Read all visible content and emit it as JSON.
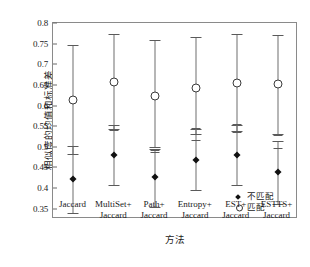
{
  "chart_data": {
    "type": "scatter",
    "title": "",
    "xlabel": "方法",
    "ylabel": "相似度的均值和标准差",
    "categories": [
      "Jaccard",
      "MultiSet+ Jaccard",
      "Path+ Jaccard",
      "Entropy+ Jaccard",
      "EST+ Jaccard",
      "ESTTS+ Jaccard"
    ],
    "category_lines": [
      [
        "Jaccard",
        ""
      ],
      [
        "MultiSet+",
        "Jaccard"
      ],
      [
        "Path+",
        "Jaccard"
      ],
      [
        "Entropy+",
        "Jaccard"
      ],
      [
        "EST+",
        "Jaccard"
      ],
      [
        "ESTTS+",
        "Jaccard"
      ]
    ],
    "ylim": [
      0.325,
      0.8
    ],
    "yticks": [
      0.35,
      0.4,
      0.45,
      0.5,
      0.55,
      0.6,
      0.65,
      0.7,
      0.75,
      0.8
    ],
    "ytick_labels": [
      "0.35",
      "0.4",
      "0.45",
      "0.5",
      "0.55",
      "0.6",
      "0.65",
      "0.7",
      "0.75",
      "0.8"
    ],
    "grid": false,
    "legend_position": "bottom-right",
    "series": [
      {
        "name": "不匹配",
        "marker": "filled-diamond",
        "values": [
          0.421,
          0.481,
          0.427,
          0.469,
          0.481,
          0.438
        ],
        "err_low": [
          0.339,
          0.407,
          0.355,
          0.396,
          0.408,
          0.362
        ],
        "err_high": [
          0.502,
          0.552,
          0.494,
          0.543,
          0.553,
          0.513
        ],
        "inner_tick": [
          0.482,
          0.54,
          0.487,
          0.517,
          0.536,
          0.497
        ]
      },
      {
        "name": "匹配",
        "marker": "open-circle",
        "values": [
          0.614,
          0.658,
          0.623,
          0.643,
          0.655,
          0.651
        ],
        "err_low": [
          0.483,
          0.543,
          0.499,
          0.531,
          0.539,
          0.531
        ],
        "err_high": [
          0.746,
          0.773,
          0.758,
          0.766,
          0.773,
          0.772
        ],
        "inner_tick": [
          0.501,
          0.553,
          0.492,
          0.545,
          0.556,
          0.529
        ]
      }
    ]
  },
  "legend": {
    "items": [
      {
        "label": "不匹配",
        "marker": "filled-diamond"
      },
      {
        "label": "匹配",
        "marker": "open-circle"
      }
    ]
  }
}
